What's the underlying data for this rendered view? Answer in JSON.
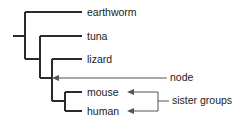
{
  "figure": {
    "type": "cladogram",
    "title": "",
    "background_color": "#ffffff",
    "tree_line_color": "#2b2b2b",
    "annotation_line_color": "#555555",
    "text_color": "#1a1a1a"
  },
  "taxa": [
    {
      "id": "earthworm",
      "label": "earthworm",
      "tip_y": 12
    },
    {
      "id": "tuna",
      "label": "tuna",
      "tip_y": 36
    },
    {
      "id": "lizard",
      "label": "lizard",
      "tip_y": 59
    },
    {
      "id": "mouse",
      "label": "mouse",
      "tip_y": 92
    },
    {
      "id": "human",
      "label": "human",
      "tip_y": 111
    }
  ],
  "annotations": [
    {
      "id": "node",
      "label": "node",
      "points_to": "lizard-mammal-node"
    },
    {
      "id": "sister-groups",
      "label": "sister groups",
      "points_to": "mouse-and-human"
    }
  ]
}
